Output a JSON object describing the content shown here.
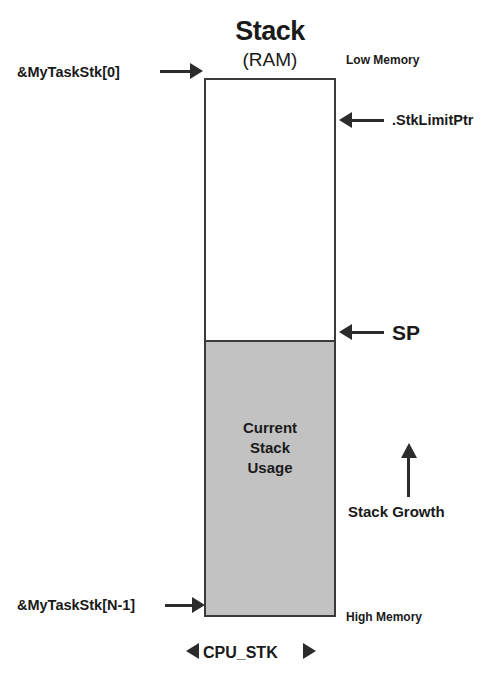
{
  "diagram": {
    "title": "Stack",
    "subtitle": "(RAM)",
    "memory_low_label": "Low Memory",
    "memory_high_label": "High Memory",
    "start_address_label": "&MyTaskStk[0]",
    "end_address_label": "&MyTaskStk[N-1]",
    "stack_limit_label": ".StkLimitPtr",
    "stack_pointer_label": "SP",
    "growth_label": "Stack Growth",
    "width_label": "CPU_STK",
    "used_region_lines": {
      "line1": "Current",
      "line2": "Stack",
      "line3": "Usage"
    },
    "colors": {
      "used_fill": "#c2c2c2",
      "free_fill": "#ffffff",
      "outline": "#3a3a3a",
      "arrow": "#2b2b2b",
      "text": "#1a1a1a"
    }
  }
}
